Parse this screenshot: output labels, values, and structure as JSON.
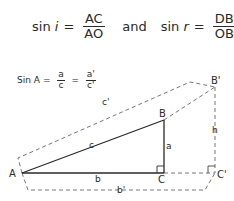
{
  "equation_top": {
    "left": {
      "lhs": "sin",
      "var": "i",
      "eq": "=",
      "num": "AC",
      "den": "AO"
    },
    "connector": "and",
    "right": {
      "lhs": "sin",
      "var": "r",
      "eq": "=",
      "num": "DB",
      "den": "OB"
    }
  },
  "equation_sine": {
    "lhs": "Sin A",
    "eq1": "=",
    "frac1": {
      "num": "a",
      "den": "c"
    },
    "eq2": "=",
    "frac2": {
      "num": "a'",
      "den": "c'"
    }
  },
  "diagram": {
    "labels": {
      "A": "A",
      "B": "B",
      "C": "C",
      "B_prime": "B'",
      "C_prime": "C'",
      "a": "a",
      "b": "b",
      "c": "c",
      "b_prime": "b'",
      "c_prime": "c'",
      "h": "h"
    },
    "colors": {
      "solid": "#2a2a2a",
      "dashed": "#555555"
    }
  }
}
